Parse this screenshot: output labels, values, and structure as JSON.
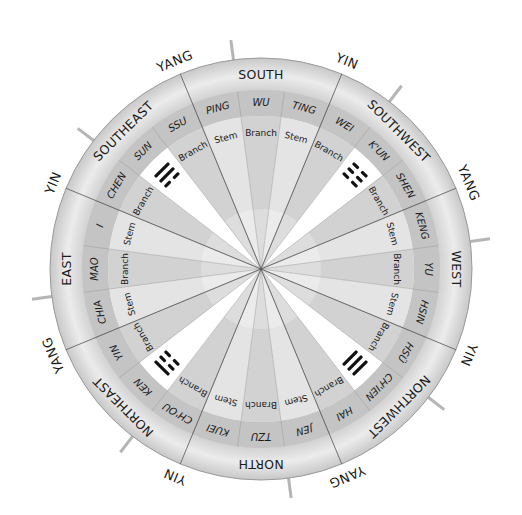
{
  "diagram": {
    "center": [
      261,
      269
    ],
    "radii": {
      "outer": 211,
      "names_outer": 179,
      "types_outer": 153
    },
    "colors": {
      "outer_ring": "#d9d9d9",
      "names_ring": "#c4c4c4",
      "inner_light": "#ffffff",
      "inner_grey": "#cfcfcf",
      "line": "#555555",
      "tick": "#b5b5b5",
      "text": "#1a1a1a"
    },
    "directions": [
      {
        "label": "SOUTH",
        "angle": 0
      },
      {
        "label": "SOUTHWEST",
        "angle": 45
      },
      {
        "label": "WEST",
        "angle": 90
      },
      {
        "label": "NORTHWEST",
        "angle": 135
      },
      {
        "label": "NORTH",
        "angle": 180
      },
      {
        "label": "NORTHEAST",
        "angle": 225
      },
      {
        "label": "EAST",
        "angle": 270
      },
      {
        "label": "SOUTHEAST",
        "angle": 315
      }
    ],
    "yin_yang": [
      {
        "label": "YIN",
        "angle": 22.5
      },
      {
        "label": "YANG",
        "angle": 67.5
      },
      {
        "label": "YIN",
        "angle": 112.5
      },
      {
        "label": "YANG",
        "angle": 157.5
      },
      {
        "label": "YIN",
        "angle": 202.5
      },
      {
        "label": "YANG",
        "angle": 247.5
      },
      {
        "label": "YIN",
        "angle": 292.5
      },
      {
        "label": "YANG",
        "angle": 337.5
      }
    ],
    "tick_angles": [
      -7.5,
      37.5,
      82.5,
      127.5,
      172.5,
      217.5,
      262.5,
      307.5
    ],
    "sectors": [
      {
        "name": "PING",
        "type": "Stem",
        "angle": -15
      },
      {
        "name": "WU",
        "type": "Branch",
        "angle": 0
      },
      {
        "name": "TING",
        "type": "Stem",
        "angle": 15
      },
      {
        "name": "WEI",
        "type": "Branch",
        "angle": 30
      },
      {
        "name": "K'UN",
        "type": "Trigram",
        "angle": 45,
        "trigram": [
          0,
          0,
          0
        ]
      },
      {
        "name": "SHEN",
        "type": "Branch",
        "angle": 60
      },
      {
        "name": "KENG",
        "type": "Stem",
        "angle": 75
      },
      {
        "name": "YU",
        "type": "Branch",
        "angle": 90
      },
      {
        "name": "HSIN",
        "type": "Stem",
        "angle": 105
      },
      {
        "name": "HSÜ",
        "type": "Branch",
        "angle": 120
      },
      {
        "name": "CH'IEN",
        "type": "Trigram",
        "angle": 135,
        "trigram": [
          1,
          1,
          1
        ]
      },
      {
        "name": "HAI",
        "type": "Branch",
        "angle": 150
      },
      {
        "name": "JEN",
        "type": "Stem",
        "angle": 165
      },
      {
        "name": "TZU",
        "type": "Branch",
        "angle": 180
      },
      {
        "name": "KUEI",
        "type": "Stem",
        "angle": 195
      },
      {
        "name": "CH'OU",
        "type": "Branch",
        "angle": 210
      },
      {
        "name": "KEN",
        "type": "Trigram",
        "angle": 225,
        "trigram": [
          1,
          0,
          0
        ]
      },
      {
        "name": "YIN",
        "type": "Branch",
        "angle": 240
      },
      {
        "name": "CHIA",
        "type": "Stem",
        "angle": 255
      },
      {
        "name": "MAO",
        "type": "Branch",
        "angle": 270
      },
      {
        "name": "I",
        "type": "Stem",
        "angle": 285
      },
      {
        "name": "CHEN",
        "type": "Branch",
        "angle": 300
      },
      {
        "name": "SUN",
        "type": "Trigram",
        "angle": 315,
        "trigram": [
          1,
          1,
          0
        ]
      },
      {
        "name": "SSU",
        "type": "Branch",
        "angle": 330
      }
    ]
  }
}
